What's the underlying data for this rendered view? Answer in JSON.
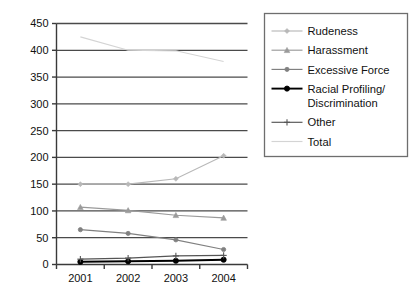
{
  "chart_data": {
    "type": "line",
    "title": "",
    "xlabel": "",
    "ylabel": "",
    "x": [
      2001,
      2002,
      2003,
      2004
    ],
    "categories": [
      "2001",
      "2002",
      "2003",
      "2004"
    ],
    "xticklabels": [
      "2001",
      "2002",
      "2003",
      "2004"
    ],
    "yticklabels": [
      "0",
      "50",
      "100",
      "150",
      "200",
      "250",
      "300",
      "350",
      "400",
      "450"
    ],
    "yticks": [
      0,
      50,
      100,
      150,
      200,
      250,
      300,
      350,
      400,
      450
    ],
    "ylim": [
      0,
      450
    ],
    "grid": "horizontal",
    "legend_position": "right-outside",
    "series": [
      {
        "name": "Rudeness",
        "values": [
          150,
          150,
          160,
          203
        ],
        "color": "#b8b8b8",
        "marker": "diamond"
      },
      {
        "name": "Harassment",
        "values": [
          107,
          101,
          92,
          87
        ],
        "color": "#9a9a9a",
        "marker": "triangle"
      },
      {
        "name": "Excessive Force",
        "values": [
          65,
          58,
          46,
          28
        ],
        "color": "#808080",
        "marker": "circle"
      },
      {
        "name": "Racial Profiling/ Discrimination",
        "values": [
          5,
          6,
          7,
          9
        ],
        "color": "#000000",
        "marker": "circle-filled"
      },
      {
        "name": "Other",
        "values": [
          10,
          12,
          16,
          17
        ],
        "color": "#555555",
        "marker": "plus"
      },
      {
        "name": "Total",
        "values": [
          425,
          400,
          399,
          379
        ],
        "color": "#d4d4d4",
        "marker": "line"
      }
    ]
  },
  "legend": {
    "items": [
      {
        "label": "Rudeness"
      },
      {
        "label": "Harassment"
      },
      {
        "label": "Excessive Force"
      },
      {
        "label": "Racial Profiling/"
      },
      {
        "label": "Discrimination"
      },
      {
        "label": "Other"
      },
      {
        "label": "Total"
      }
    ]
  },
  "axes": {
    "y_labels": [
      "450",
      "400",
      "350",
      "300",
      "250",
      "200",
      "150",
      "100",
      "50",
      "0"
    ],
    "x_labels": [
      "2001",
      "2002",
      "2003",
      "2004"
    ]
  },
  "colors": {
    "axis": "#3a3a3a",
    "gridline": "#4a4a4a",
    "legend_border": "#6e6e6e",
    "background": "#ffffff"
  }
}
